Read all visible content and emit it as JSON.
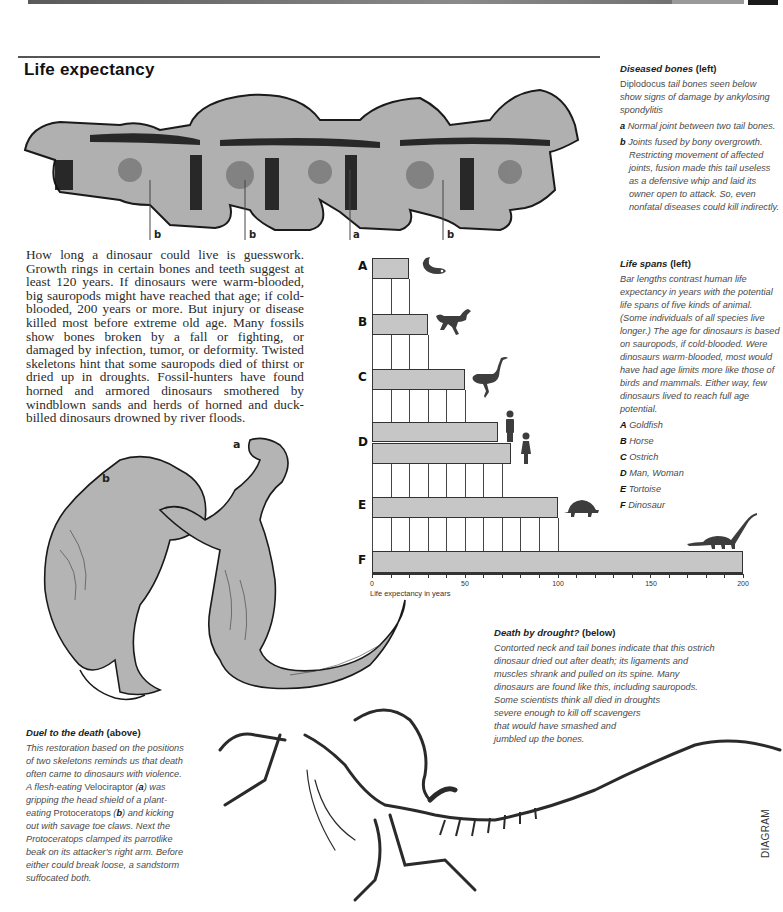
{
  "page": {
    "title": "Life expectancy",
    "side_marker": "DIAGRAM"
  },
  "bones_figure": {
    "labels": [
      "b",
      "b",
      "a",
      "b"
    ]
  },
  "body_text": "How long a dinosaur could live is guesswork. Growth rings in certain bones and teeth suggest at least 120 years. If dinosaurs were warm-blooded, big sauropods might have reached that age; if cold-blooded, 200 years or more. But injury or disease killed most before extreme old age. Many fossils show bones broken by a fall or fighting, or damaged by infection, tumor, or deformity. Twisted skeletons hint that some sauropods died of thirst or dried up in droughts. Fossil-hunters have found horned and armored dinosaurs smothered by windblown sands and herds of horned and duck-billed dinosaurs drowned by river floods.",
  "captions": {
    "diseased_bones": {
      "title": "Diseased bones",
      "direction": "(left)",
      "intro_upright": "Diplodocus",
      "intro_rest": " tail bones seen below show signs of damage by ankylosing spondylitis",
      "items": [
        {
          "key": "a",
          "text": "Normal joint between two tail bones."
        },
        {
          "key": "b",
          "text": "Joints fused by bony overgrowth. Restricting movement of affected joints, fusion made this tail useless as a defensive whip and laid its owner open to attack. So, even nonfatal diseases could kill indirectly."
        }
      ]
    },
    "life_spans": {
      "title": "Life spans",
      "direction": "(left)",
      "text": "Bar lengths contrast human life expectancy in years with the potential life spans of five kinds of animal. (Some individuals of all species live longer.) The age for dinosaurs is based on sauropods, if cold-blooded. Were dinosaurs warm-blooded, most would have had age limits more like those of birds and mammals. Either way, few dinosaurs lived to reach full age potential.",
      "legend": [
        {
          "key": "A",
          "label": "Goldfish"
        },
        {
          "key": "B",
          "label": "Horse"
        },
        {
          "key": "C",
          "label": "Ostrich"
        },
        {
          "key": "D",
          "label": "Man, Woman"
        },
        {
          "key": "E",
          "label": "Tortoise"
        },
        {
          "key": "F",
          "label": "Dinosaur"
        }
      ]
    },
    "death_by_drought": {
      "title": "Death by drought?",
      "direction": "(below)",
      "lines": [
        "Contorted neck and tail bones indicate that this ostrich",
        "dinosaur dried out after death; its ligaments and",
        "muscles shrank and pulled on its spine. Many",
        "dinosaurs are found like this, including sauropods.",
        "Some scientists think all died in droughts",
        "severe enough to kill off scavengers",
        "that would have smashed and",
        "jumbled up the bones."
      ]
    },
    "duel": {
      "title": "Duel to the death",
      "direction": "(above)",
      "p1": "This restoration based on the positions of two skeletons reminds us that death often came to dinosaurs with violence. A flesh-eating ",
      "velo": "Velociraptor",
      "p2": " (",
      "key_a": "a",
      "p3": ") was gripping the head shield of a plant-eating ",
      "proto": "Protoceratops",
      "p4": " (",
      "key_b": "b",
      "p5": ") and kicking out with savage toe claws. Next the Protoceratops clamped its parrotlike beak on its attacker's right arm. Before either could break loose, a sandstorm suffocated both."
    }
  },
  "duel_figure": {
    "label_a": "a",
    "label_b": "b"
  },
  "chart_data": {
    "type": "bar",
    "orientation": "horizontal",
    "title": "Life spans",
    "xlabel": "Life expectancy in years",
    "ylabel": "",
    "xlim": [
      0,
      200
    ],
    "x_ticks": [
      0,
      50,
      100,
      150,
      200
    ],
    "minor_tick_step": 10,
    "categories": [
      "A",
      "B",
      "C",
      "D",
      "D",
      "E",
      "F"
    ],
    "series": [
      {
        "name": "Life expectancy (years)",
        "values": [
          {
            "category": "A",
            "label": "Goldfish",
            "value": 20
          },
          {
            "category": "B",
            "label": "Horse",
            "value": 30
          },
          {
            "category": "C",
            "label": "Ostrich",
            "value": 50
          },
          {
            "category": "D",
            "label": "Man",
            "value": 68
          },
          {
            "category": "D",
            "label": "Woman",
            "value": 75
          },
          {
            "category": "E",
            "label": "Tortoise",
            "value": 100
          },
          {
            "category": "F",
            "label": "Dinosaur",
            "value": 200
          }
        ]
      }
    ],
    "bar_color": "#c6c6c6",
    "grid": "vertical lines every 10 years in staircase between bars",
    "legend_position": "right (text caption)"
  },
  "colors": {
    "bar_fill": "#c6c6c6",
    "bar_border": "#333333",
    "ink": "#222222",
    "caption_text": "#4a4a4a",
    "silhouette": "#3d3d3d",
    "illustration_fill": "#b4b4b4"
  }
}
